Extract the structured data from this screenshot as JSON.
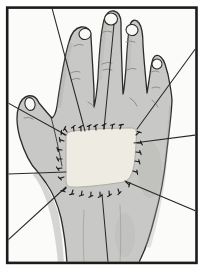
{
  "figure": {
    "alt": "Medical illustration of a hand, dorsal side up with thumb on the left, showing a light rectangular skin graft sutured in place; short suture ticks surround the graft and nine long tie-over suture threads radiate outward to the black picture frame",
    "colors": {
      "page_bg": "#ffffff",
      "panel": "#fbfbf9",
      "frame": "#1c1c1a",
      "hand": "#c8c8c6",
      "hand_outline": "#2b2b29",
      "shading": "#a7a7a5",
      "crease": "#8e8e8c",
      "graft": "#edebe2",
      "graft_edge": "#aaa79c",
      "nail": "#f8f8f5",
      "thread": "#2a2a28",
      "tick": "#1c1c1a"
    },
    "threads": [
      [
        52,
        8,
        85,
        131
      ],
      [
        114,
        24,
        104,
        129
      ],
      [
        196,
        48,
        137,
        129
      ],
      [
        196,
        135,
        134,
        143
      ],
      [
        196,
        211,
        125,
        181
      ],
      [
        7,
        174,
        66,
        172
      ],
      [
        8,
        103,
        66,
        135
      ],
      [
        7,
        241,
        66,
        187
      ],
      [
        102,
        194,
        108,
        262
      ]
    ],
    "ticks": [
      [
        67,
        132,
        -122
      ],
      [
        74,
        131,
        -98
      ],
      [
        81,
        131,
        -92
      ],
      [
        89,
        130,
        -86
      ],
      [
        96,
        130,
        -94
      ],
      [
        104,
        129,
        -88
      ],
      [
        112,
        129,
        -80
      ],
      [
        120,
        129,
        -72
      ],
      [
        136,
        135,
        -42
      ],
      [
        137,
        143,
        2
      ],
      [
        136,
        152,
        8
      ],
      [
        135,
        161,
        12
      ],
      [
        133,
        171,
        18
      ],
      [
        126,
        182,
        42
      ],
      [
        118,
        189,
        72
      ],
      [
        109,
        191,
        84
      ],
      [
        100,
        192,
        89
      ],
      [
        91,
        192,
        93
      ],
      [
        82,
        191,
        99
      ],
      [
        73,
        190,
        108
      ],
      [
        66,
        188,
        135
      ],
      [
        64,
        177,
        163
      ],
      [
        62,
        168,
        172
      ],
      [
        62,
        159,
        181
      ],
      [
        62,
        150,
        188
      ],
      [
        64,
        141,
        198
      ],
      [
        65,
        135,
        215
      ]
    ]
  }
}
